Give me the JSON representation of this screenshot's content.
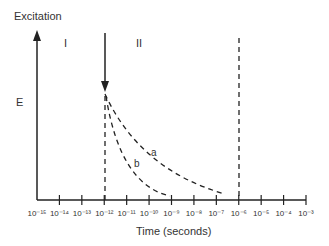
{
  "y_axis": {
    "label": "Excitation",
    "energy_label": "E"
  },
  "regions": {
    "first": "I",
    "second": "II"
  },
  "x_axis": {
    "label": "Time (seconds)",
    "ticks": [
      "10⁻¹⁵",
      "10⁻¹⁴",
      "10⁻¹³",
      "10⁻¹²",
      "10⁻¹¹",
      "10⁻¹⁰",
      "10⁻⁹",
      "10⁻⁸",
      "10⁻⁷",
      "10⁻⁶",
      "10⁻⁵",
      "10⁻⁴",
      "10⁻³"
    ]
  },
  "curves": {
    "a": "a",
    "b": "b"
  }
}
